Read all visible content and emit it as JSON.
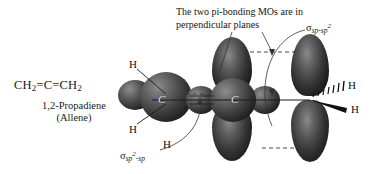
{
  "figure": {
    "name": "allene-orbital-diagram",
    "background_color": "#ffffff",
    "orbital_color_dark": "#0d0d0d",
    "orbital_color_light": "#8e8e8e",
    "line_color": "#1a1a1a"
  },
  "molecule": {
    "formula_prefix": "CH",
    "formula_sub_1": "2",
    "formula_bond_1": "=C=",
    "formula_suffix": "CH",
    "formula_sub_2": "2",
    "iupac_name": "1,2-Propadiene",
    "common_name": "(Allene)"
  },
  "caption": {
    "text": "The two pi-bonding MOs are in perpendicular planes"
  },
  "labels": {
    "sigma_sp_sp2": {
      "glyph": "σ",
      "sub_1": "sp",
      "sep": "-",
      "sub_2": "sp",
      "sup_2": "2"
    },
    "sigma_sp2_sp": {
      "glyph": "σ",
      "sub_1": "sp",
      "sup_1": "2",
      "sep": "-",
      "sub_2": "sp"
    }
  },
  "atoms": {
    "hydrogen_top_left": "H",
    "hydrogen_bottom_left": "H",
    "hydrogen_middle": "H",
    "hydrogen_right_top": "H",
    "hydrogen_right_bottom": "H",
    "carbon_left": "C",
    "carbon_center": "C"
  }
}
